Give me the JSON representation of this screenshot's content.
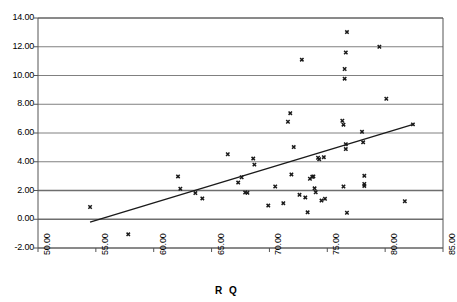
{
  "chart_data": {
    "type": "scatter",
    "title": "",
    "xlabel": "R Q",
    "ylabel": "",
    "xlim": [
      50.0,
      85.0
    ],
    "ylim": [
      -2.0,
      14.0
    ],
    "xticks": [
      "50.00",
      "55.00",
      "60.00",
      "65.00",
      "70.00",
      "75.00",
      "80.00",
      "85.00"
    ],
    "yticks": [
      "14.00",
      "12.00",
      "10.00",
      "8.00",
      "6.00",
      "4.00",
      "2.00",
      "0.00",
      "-2.00"
    ],
    "xtick_values": [
      50,
      55,
      60,
      65,
      70,
      75,
      80,
      85
    ],
    "ytick_values": [
      14,
      12,
      10,
      8,
      6,
      4,
      2,
      0,
      -2
    ],
    "grid": "horizontal",
    "legend": "none",
    "marker": "x",
    "marker_color": "#1a1a1a",
    "gridline_color": "#808080",
    "emphasis_gridlines": [
      0,
      2
    ],
    "axis_color": "#555555",
    "points": [
      [
        54.5,
        0.85
      ],
      [
        57.8,
        -1.05
      ],
      [
        62.1,
        2.98
      ],
      [
        62.3,
        2.12
      ],
      [
        63.6,
        1.82
      ],
      [
        64.2,
        1.45
      ],
      [
        66.4,
        4.52
      ],
      [
        67.3,
        2.55
      ],
      [
        67.6,
        2.92
      ],
      [
        67.9,
        1.86
      ],
      [
        68.1,
        1.84
      ],
      [
        68.6,
        4.22
      ],
      [
        68.7,
        3.8
      ],
      [
        69.9,
        0.95
      ],
      [
        70.5,
        2.28
      ],
      [
        71.2,
        1.12
      ],
      [
        71.6,
        6.78
      ],
      [
        71.8,
        7.38
      ],
      [
        71.9,
        3.12
      ],
      [
        72.1,
        5.02
      ],
      [
        72.6,
        1.7
      ],
      [
        72.8,
        11.1
      ],
      [
        73.1,
        1.52
      ],
      [
        73.3,
        0.48
      ],
      [
        73.5,
        2.82
      ],
      [
        73.7,
        2.95
      ],
      [
        73.8,
        2.98
      ],
      [
        73.9,
        2.15
      ],
      [
        74.0,
        1.88
      ],
      [
        74.2,
        4.28
      ],
      [
        74.3,
        4.18
      ],
      [
        74.5,
        1.3
      ],
      [
        74.7,
        4.32
      ],
      [
        74.8,
        1.42
      ],
      [
        76.3,
        6.85
      ],
      [
        76.4,
        6.58
      ],
      [
        76.5,
        9.78
      ],
      [
        76.5,
        10.45
      ],
      [
        76.6,
        11.6
      ],
      [
        76.7,
        13.02
      ],
      [
        76.6,
        5.22
      ],
      [
        76.6,
        4.88
      ],
      [
        76.4,
        2.28
      ],
      [
        76.7,
        0.45
      ],
      [
        78.0,
        6.08
      ],
      [
        78.1,
        5.35
      ],
      [
        78.2,
        3.02
      ],
      [
        78.2,
        2.45
      ],
      [
        78.2,
        2.32
      ],
      [
        79.5,
        12.0
      ],
      [
        80.1,
        8.38
      ],
      [
        81.7,
        1.25
      ],
      [
        82.4,
        6.6
      ]
    ],
    "trendline": {
      "x0": 54.5,
      "y0": -0.2,
      "x1": 82.5,
      "y1": 6.62,
      "color": "#1a1a1a"
    }
  }
}
